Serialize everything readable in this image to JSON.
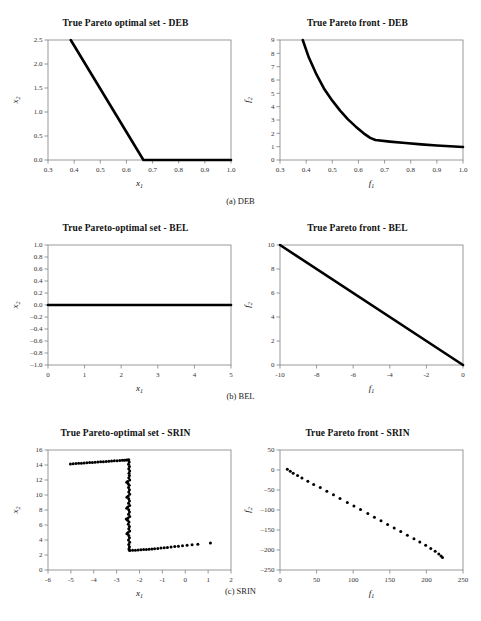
{
  "figure": {
    "panels": [
      {
        "id": "deb-set",
        "title": "True Pareto optimal set - DEB",
        "xlabel": "x",
        "xsub": "1",
        "ylabel": "x",
        "ysub": "2",
        "xticks": [
          "0.3",
          "0.4",
          "0.5",
          "0.6",
          "0.7",
          "0.8",
          "0.9",
          "1.0"
        ],
        "yticks": [
          "0.0",
          "0.5",
          "1.0",
          "1.5",
          "2.0",
          "2.5"
        ],
        "xlim": [
          0.3,
          1.0
        ],
        "ylim": [
          0.0,
          2.5
        ]
      },
      {
        "id": "deb-front",
        "title": "True Pareto front - DEB",
        "xlabel": "f",
        "xsub": "1",
        "ylabel": "f",
        "ysub": "2",
        "xticks": [
          "0.3",
          "0.4",
          "0.5",
          "0.6",
          "0.7",
          "0.8",
          "0.9",
          "1.0"
        ],
        "yticks": [
          "0",
          "1",
          "2",
          "3",
          "4",
          "5",
          "6",
          "7",
          "8",
          "9"
        ],
        "xlim": [
          0.3,
          1.0
        ],
        "ylim": [
          0,
          9
        ]
      },
      {
        "id": "bel-set",
        "title": "True Pareto-optimal set - BEL",
        "xlabel": "x",
        "xsub": "1",
        "ylabel": "x",
        "ysub": "2",
        "xticks": [
          "0",
          "1",
          "2",
          "3",
          "4",
          "5"
        ],
        "yticks": [
          "-1.0",
          "-0.8",
          "-0.6",
          "-0.4",
          "-0.2",
          "0.0",
          "0.2",
          "0.4",
          "0.6",
          "0.8",
          "1.0"
        ],
        "xlim": [
          0,
          5
        ],
        "ylim": [
          -1.0,
          1.0
        ]
      },
      {
        "id": "bel-front",
        "title": "True Pareto front - BEL",
        "xlabel": "f",
        "xsub": "1",
        "ylabel": "f",
        "ysub": "2",
        "xticks": [
          "-10",
          "-8",
          "-6",
          "-4",
          "-2",
          "0"
        ],
        "yticks": [
          "0",
          "2",
          "4",
          "6",
          "8",
          "10"
        ],
        "xlim": [
          -10,
          0
        ],
        "ylim": [
          0,
          10
        ]
      },
      {
        "id": "srin-set",
        "title": "True Pareto-optimal set - SRIN",
        "xlabel": "x",
        "xsub": "1",
        "ylabel": "x",
        "ysub": "2",
        "xticks": [
          "-6",
          "-5",
          "-4",
          "-3",
          "-2",
          "-1",
          "0",
          "1",
          "2"
        ],
        "yticks": [
          "0",
          "2",
          "4",
          "6",
          "8",
          "10",
          "12",
          "14",
          "16"
        ],
        "xlim": [
          -6,
          2
        ],
        "ylim": [
          0,
          16
        ]
      },
      {
        "id": "srin-front",
        "title": "True Pareto front - SRIN",
        "xlabel": "f",
        "xsub": "1",
        "ylabel": "f",
        "ysub": "2",
        "xticks": [
          "0",
          "50",
          "100",
          "150",
          "200",
          "250"
        ],
        "yticks": [
          "-250",
          "-200",
          "-150",
          "-100",
          "-50",
          "0",
          "50"
        ],
        "xlim": [
          0,
          250
        ],
        "ylim": [
          -250,
          50
        ]
      }
    ],
    "captions": [
      "(a) DEB",
      "(b) BEL",
      "(c) SRIN"
    ],
    "colors": {
      "line": "#000000",
      "axis": "#808080",
      "text": "#111111"
    }
  },
  "chart_data": [
    {
      "id": "deb-set",
      "type": "line",
      "title": "True Pareto optimal set - DEB",
      "xlabel": "x1",
      "ylabel": "x2",
      "xlim": [
        0.3,
        1.0
      ],
      "ylim": [
        0.0,
        2.5
      ],
      "grid": false,
      "legend": null,
      "points": [
        [
          0.387,
          2.5
        ],
        [
          0.665,
          0.0
        ],
        [
          1.0,
          0.0
        ]
      ],
      "description": "Piecewise-linear: steep descent from (0.387,2.5) to (0.665,0) then flat at x2=0 up to x1=1.0"
    },
    {
      "id": "deb-front",
      "type": "line",
      "title": "True Pareto front - DEB",
      "xlabel": "f1",
      "ylabel": "f2",
      "xlim": [
        0.3,
        1.0
      ],
      "ylim": [
        0,
        9
      ],
      "grid": false,
      "legend": null,
      "points": [
        [
          0.387,
          9.0
        ],
        [
          0.41,
          7.7
        ],
        [
          0.44,
          6.4
        ],
        [
          0.47,
          5.3
        ],
        [
          0.5,
          4.45
        ],
        [
          0.53,
          3.7
        ],
        [
          0.56,
          3.05
        ],
        [
          0.59,
          2.5
        ],
        [
          0.62,
          2.0
        ],
        [
          0.645,
          1.66
        ],
        [
          0.665,
          1.5
        ],
        [
          0.72,
          1.38
        ],
        [
          0.78,
          1.27
        ],
        [
          0.84,
          1.17
        ],
        [
          0.9,
          1.09
        ],
        [
          0.95,
          1.03
        ],
        [
          1.0,
          0.98
        ]
      ],
      "description": "Convex decreasing curve from (0.387,9) steeply falling, knee near (0.665,1.5), then gently flattening toward (1.0,1.0)"
    },
    {
      "id": "bel-set",
      "type": "line",
      "title": "True Pareto-optimal set - BEL",
      "xlabel": "x1",
      "ylabel": "x2",
      "xlim": [
        0,
        5
      ],
      "ylim": [
        -1.0,
        1.0
      ],
      "grid": false,
      "legend": null,
      "points": [
        [
          0.0,
          0.0
        ],
        [
          5.0,
          0.0
        ]
      ],
      "description": "Horizontal line at x2 = 0 spanning x1 from 0 to 5"
    },
    {
      "id": "bel-front",
      "type": "line",
      "title": "True Pareto front - BEL",
      "xlabel": "f1",
      "ylabel": "f2",
      "xlim": [
        -10,
        0
      ],
      "ylim": [
        0,
        10
      ],
      "grid": false,
      "legend": null,
      "points": [
        [
          -10.0,
          10.0
        ],
        [
          0.0,
          0.0
        ]
      ],
      "description": "Straight descending line from (-10,10) to (0,0)"
    },
    {
      "id": "srin-set",
      "type": "scatter",
      "title": "True Pareto-optimal set - SRIN",
      "xlabel": "x1",
      "ylabel": "x2",
      "xlim": [
        -6,
        2
      ],
      "ylim": [
        0,
        16
      ],
      "grid": false,
      "legend": null,
      "points": [
        [
          -5.02,
          14.15
        ],
        [
          -4.9,
          14.18
        ],
        [
          -4.78,
          14.2
        ],
        [
          -4.66,
          14.22
        ],
        [
          -4.54,
          14.25
        ],
        [
          -4.42,
          14.28
        ],
        [
          -4.3,
          14.3
        ],
        [
          -4.18,
          14.33
        ],
        [
          -4.06,
          14.35
        ],
        [
          -3.94,
          14.38
        ],
        [
          -3.82,
          14.4
        ],
        [
          -3.7,
          14.43
        ],
        [
          -3.58,
          14.45
        ],
        [
          -3.46,
          14.48
        ],
        [
          -3.34,
          14.5
        ],
        [
          -3.22,
          14.53
        ],
        [
          -3.1,
          14.56
        ],
        [
          -2.98,
          14.58
        ],
        [
          -2.86,
          14.6
        ],
        [
          -2.75,
          14.63
        ],
        [
          -2.66,
          14.65
        ],
        [
          -2.58,
          14.67
        ],
        [
          -2.52,
          14.68
        ],
        [
          -2.47,
          14.7
        ],
        [
          -2.45,
          14.4
        ],
        [
          -2.48,
          14.1
        ],
        [
          -2.44,
          13.8
        ],
        [
          -2.47,
          13.5
        ],
        [
          -2.43,
          13.2
        ],
        [
          -2.46,
          12.9
        ],
        [
          -2.44,
          12.6
        ],
        [
          -2.47,
          12.3
        ],
        [
          -2.43,
          12.0
        ],
        [
          -2.52,
          11.8
        ],
        [
          -2.56,
          11.7
        ],
        [
          -2.5,
          11.55
        ],
        [
          -2.45,
          11.3
        ],
        [
          -2.48,
          11.0
        ],
        [
          -2.44,
          10.7
        ],
        [
          -2.47,
          10.4
        ],
        [
          -2.43,
          10.1
        ],
        [
          -2.5,
          9.85
        ],
        [
          -2.55,
          9.7
        ],
        [
          -2.47,
          9.5
        ],
        [
          -2.44,
          9.2
        ],
        [
          -2.48,
          8.9
        ],
        [
          -2.43,
          8.6
        ],
        [
          -2.51,
          8.4
        ],
        [
          -2.56,
          8.25
        ],
        [
          -2.47,
          8.05
        ],
        [
          -2.44,
          7.75
        ],
        [
          -2.48,
          7.45
        ],
        [
          -2.43,
          7.15
        ],
        [
          -2.5,
          6.95
        ],
        [
          -2.58,
          6.8
        ],
        [
          -2.52,
          6.65
        ],
        [
          -2.46,
          6.4
        ],
        [
          -2.49,
          6.1
        ],
        [
          -2.44,
          5.8
        ],
        [
          -2.47,
          5.5
        ],
        [
          -2.43,
          5.2
        ],
        [
          -2.5,
          5.0
        ],
        [
          -2.55,
          4.85
        ],
        [
          -2.47,
          4.6
        ],
        [
          -2.44,
          4.3
        ],
        [
          -2.48,
          4.0
        ],
        [
          -2.43,
          3.7
        ],
        [
          -2.47,
          3.4
        ],
        [
          -2.44,
          3.1
        ],
        [
          -2.46,
          2.85
        ],
        [
          -2.45,
          2.68
        ],
        [
          -2.42,
          2.6
        ],
        [
          -2.3,
          2.62
        ],
        [
          -2.18,
          2.65
        ],
        [
          -2.06,
          2.67
        ],
        [
          -1.94,
          2.7
        ],
        [
          -1.82,
          2.72
        ],
        [
          -1.7,
          2.75
        ],
        [
          -1.58,
          2.78
        ],
        [
          -1.46,
          2.8
        ],
        [
          -1.34,
          2.84
        ],
        [
          -1.2,
          2.88
        ],
        [
          -1.06,
          2.92
        ],
        [
          -0.92,
          2.96
        ],
        [
          -0.78,
          3.0
        ],
        [
          -0.62,
          3.06
        ],
        [
          -0.46,
          3.12
        ],
        [
          -0.3,
          3.18
        ],
        [
          -0.12,
          3.24
        ],
        [
          0.08,
          3.3
        ],
        [
          0.3,
          3.38
        ],
        [
          0.55,
          3.45
        ],
        [
          1.1,
          3.6
        ]
      ],
      "description": "Scattered Z-shaped point cloud: upper near-horizontal arm at x2 about 14.2-14.7 from x1=-5 to -2.5; dense vertical cluster at x1 about -2.5 spanning x2 from 2.6 to 14.7; lower arm rising slowly from (-2.4,2.6) to (1.1,3.6)"
    },
    {
      "id": "srin-front",
      "type": "scatter",
      "title": "True Pareto front - SRIN",
      "xlabel": "f1",
      "ylabel": "f2",
      "xlim": [
        0,
        250
      ],
      "ylim": [
        -250,
        50
      ],
      "grid": false,
      "legend": null,
      "points": [
        [
          10,
          2
        ],
        [
          14,
          -3
        ],
        [
          18,
          -8
        ],
        [
          24,
          -14
        ],
        [
          30,
          -20
        ],
        [
          38,
          -28
        ],
        [
          46,
          -36
        ],
        [
          55,
          -44
        ],
        [
          64,
          -53
        ],
        [
          73,
          -62
        ],
        [
          82,
          -71
        ],
        [
          92,
          -81
        ],
        [
          101,
          -90
        ],
        [
          110,
          -99
        ],
        [
          120,
          -109
        ],
        [
          129,
          -118
        ],
        [
          138,
          -127
        ],
        [
          147,
          -136
        ],
        [
          156,
          -145
        ],
        [
          165,
          -154
        ],
        [
          174,
          -163
        ],
        [
          183,
          -172
        ],
        [
          191,
          -180
        ],
        [
          199,
          -188
        ],
        [
          206,
          -196
        ],
        [
          212,
          -203
        ],
        [
          217,
          -210
        ],
        [
          220,
          -215
        ],
        [
          222,
          -219
        ]
      ],
      "description": "Dense band of points descending from about (10,0) to (222,-220), slightly concave near the start"
    }
  ]
}
